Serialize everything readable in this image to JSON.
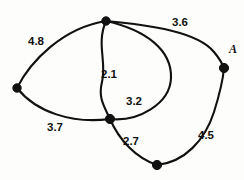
{
  "figure": {
    "background_color": "#fdfdfc",
    "stroke_color": "#111111"
  },
  "vertices": [
    {
      "id": "top",
      "label": "",
      "cx": 106,
      "cy": 21,
      "r": 4.2
    },
    {
      "id": "left",
      "label": "",
      "cx": 17,
      "cy": 88,
      "r": 4.2
    },
    {
      "id": "middle",
      "label": "",
      "cx": 110,
      "cy": 119,
      "r": 4.6
    },
    {
      "id": "bottom",
      "label": "",
      "cx": 157,
      "cy": 165,
      "r": 4.6
    },
    {
      "id": "A",
      "label": "A",
      "cx": 224,
      "cy": 68,
      "r": 4.6
    }
  ],
  "vertex_labels": [
    {
      "for": "A",
      "text": "A",
      "x": 229,
      "y": 53
    }
  ],
  "edges": [
    {
      "id": "edge-left-top",
      "from": "left",
      "to": "top",
      "weight": "4.8",
      "label_x": 28,
      "label_y": 45,
      "path": "M 17 88 C 30 62 62 28 106 21"
    },
    {
      "id": "edge-top-middle",
      "from": "top",
      "to": "middle",
      "weight": "2.1",
      "label_x": 101,
      "label_y": 78,
      "path": "M 106 21 C 96 44 107 62 102 82 C 98 98 104 106 110 119"
    },
    {
      "id": "edge-top-middle-outer",
      "from": "top",
      "to": "middle",
      "weight": "3.2",
      "label_x": 126,
      "label_y": 105,
      "path": "M 106 21 C 146 30 172 50 171 78 C 170 104 138 122 110 119"
    },
    {
      "id": "edge-top-A",
      "from": "top",
      "to": "A",
      "weight": "3.6",
      "label_x": 172,
      "label_y": 26,
      "path": "M 106 21 C 150 25 198 32 214 52 C 219 58 222 63 224 68"
    },
    {
      "id": "edge-left-middle",
      "from": "left",
      "to": "middle",
      "weight": "3.7",
      "label_x": 47,
      "label_y": 131,
      "path": "M 17 88 C 36 112 72 124 110 119"
    },
    {
      "id": "edge-middle-bottom",
      "from": "middle",
      "to": "bottom",
      "weight": "2.7",
      "label_x": 123,
      "label_y": 145,
      "path": "M 110 119 C 119 140 136 158 157 165"
    },
    {
      "id": "edge-bottom-A",
      "from": "bottom",
      "to": "A",
      "weight": "4.5",
      "label_x": 198,
      "label_y": 139,
      "path": "M 157 165 C 185 162 205 140 214 112 C 219 96 223 80 224 68"
    }
  ]
}
